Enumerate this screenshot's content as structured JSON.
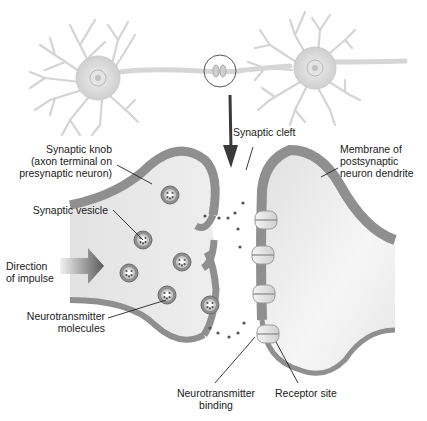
{
  "diagram": {
    "labels": {
      "synaptic_cleft": "Synaptic cleft",
      "synaptic_knob": "Synaptic knob\n(axon terminal on\npresynaptic neuron)",
      "membrane": "Membrane of\npostsynaptic\nneuron dendrite",
      "synaptic_vesicle": "Synaptic vesicle",
      "direction": "Direction\nof impulse",
      "neurotransmitter_molecules": "Neurotransmitter\nmolecules",
      "neurotransmitter_binding": "Neurotransmitter\nbinding",
      "receptor_site": "Receptor site"
    },
    "colors": {
      "cell_fill": "#e6e6e6",
      "membrane": "#8f8f8f",
      "membrane_edge": "#6e6e6e",
      "neuron": "#d9d9d9",
      "arrow": "#3a3a3a"
    }
  }
}
